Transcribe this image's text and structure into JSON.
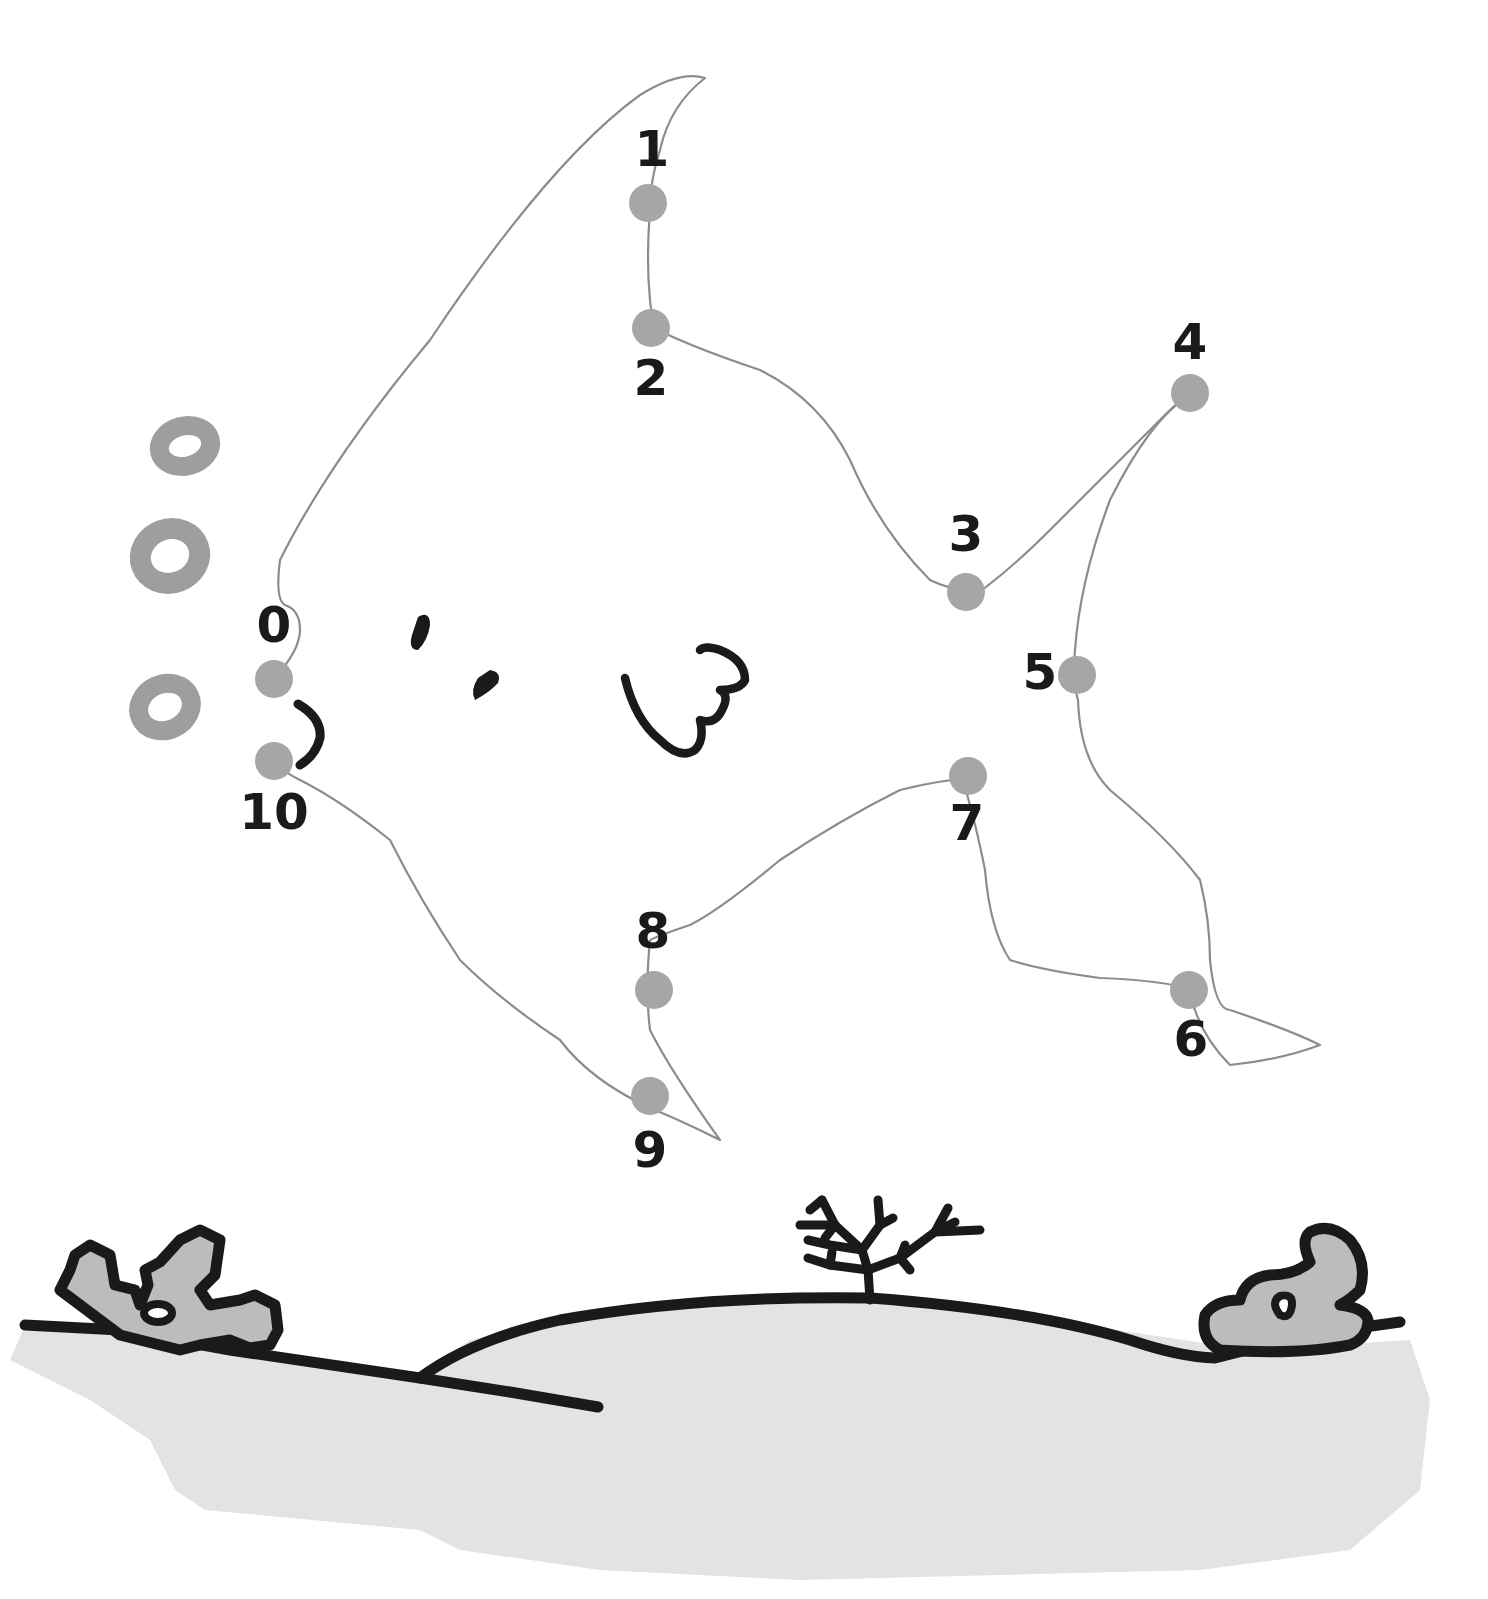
{
  "puzzle": {
    "type": "connect-the-dots",
    "subject": "fish",
    "colors": {
      "dot": "#a6a6a6",
      "drawn_line": "#8c8c8c",
      "ink": "#1a1a1a",
      "bubble": "#9e9e9e",
      "seabed": "#e3e3e3",
      "rock": "#bcbcbc",
      "background": "#ffffff"
    },
    "dots": [
      {
        "label": "0",
        "x": 274,
        "y": 679,
        "lx": 274,
        "ly": 628
      },
      {
        "label": "1",
        "x": 648,
        "y": 203,
        "lx": 652,
        "ly": 152
      },
      {
        "label": "2",
        "x": 651,
        "y": 328,
        "lx": 651,
        "ly": 381
      },
      {
        "label": "3",
        "x": 966,
        "y": 592,
        "lx": 966,
        "ly": 537
      },
      {
        "label": "4",
        "x": 1190,
        "y": 393,
        "lx": 1190,
        "ly": 345
      },
      {
        "label": "5",
        "x": 1077,
        "y": 675,
        "lx": 1040,
        "ly": 675
      },
      {
        "label": "6",
        "x": 1189,
        "y": 990,
        "lx": 1191,
        "ly": 1042
      },
      {
        "label": "7",
        "x": 968,
        "y": 776,
        "lx": 967,
        "ly": 826
      },
      {
        "label": "8",
        "x": 654,
        "y": 990,
        "lx": 653,
        "ly": 934
      },
      {
        "label": "9",
        "x": 650,
        "y": 1096,
        "lx": 650,
        "ly": 1153
      },
      {
        "label": "10",
        "x": 274,
        "y": 761,
        "lx": 274,
        "ly": 815
      }
    ]
  }
}
